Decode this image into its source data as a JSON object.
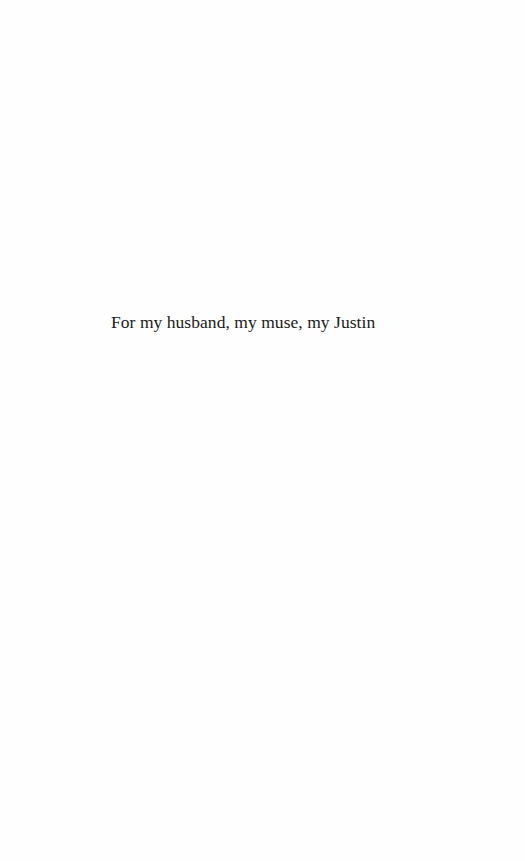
{
  "page": {
    "type": "dedication",
    "dedication_text": "For my husband, my muse, my Justin"
  },
  "colors": {
    "background": "#fefefe",
    "text": "#1a1a1a"
  }
}
